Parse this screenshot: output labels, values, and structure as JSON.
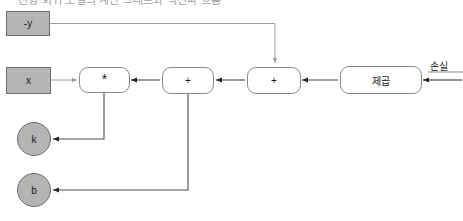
{
  "title": "선형 회귀 모델의 계산 그래프와 역전파 흐름",
  "nodes": {
    "neg_y": {
      "label": "-y",
      "shape": "rect",
      "fill": "#b4b4b4"
    },
    "x": {
      "label": "x",
      "shape": "rect",
      "fill": "#b4b4b4"
    },
    "multiply": {
      "label": "*",
      "shape": "rounded-rect",
      "fill": "#ffffff"
    },
    "add_b": {
      "label": "+",
      "shape": "rounded-rect",
      "fill": "#ffffff"
    },
    "add_negy": {
      "label": "+",
      "shape": "rounded-rect",
      "fill": "#ffffff"
    },
    "square": {
      "label": "제곱",
      "shape": "rounded-rect",
      "fill": "#ffffff"
    },
    "grad_k": {
      "label": "k",
      "shape": "circle",
      "fill": "#b4b4b4"
    },
    "grad_b": {
      "label": "b",
      "shape": "circle",
      "fill": "#b4b4b4"
    }
  },
  "labels": {
    "loss": "손실"
  },
  "colors": {
    "node_fill_gray": "#b4b4b4",
    "node_border_gray": "#6e6e6e",
    "op_border": "#8a8a8a",
    "wire_dark": "#262626",
    "wire_light": "#9e9e9e",
    "text": "#1b1b1b",
    "background": "#ffffff"
  }
}
